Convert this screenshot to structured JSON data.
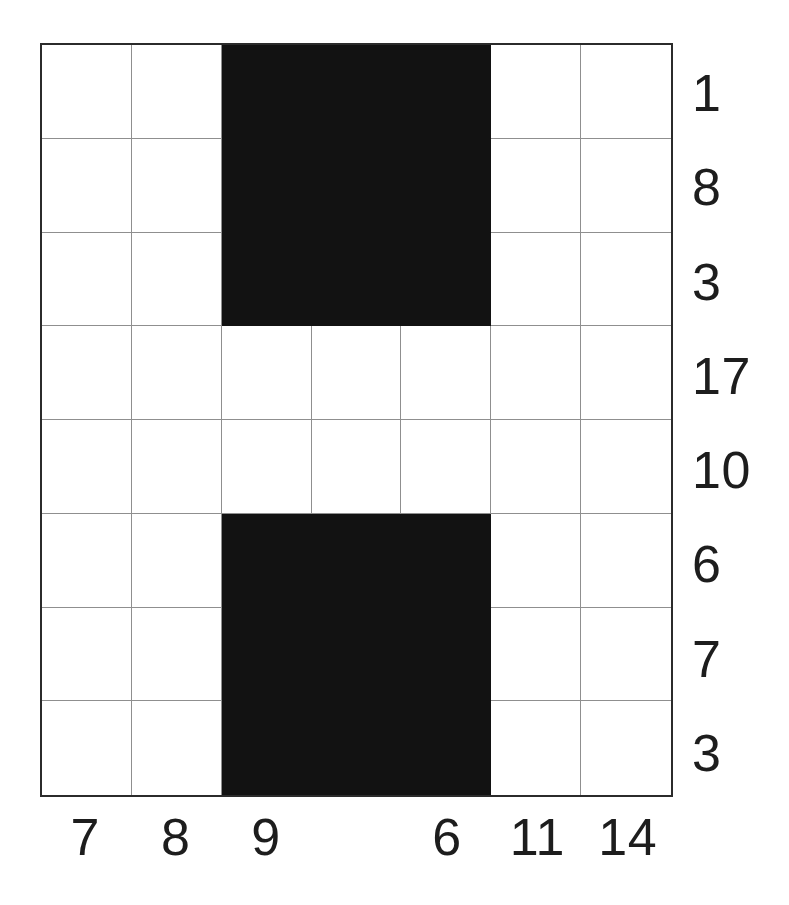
{
  "puzzle": {
    "type": "nonogram-like-grid",
    "columns": 7,
    "rows": 8,
    "fill_color": "#121212",
    "empty_color": "#ffffff",
    "gridline_color": "#8f8f8f",
    "border_color": "#2b2b2b",
    "row_labels": [
      "1",
      "8",
      "3",
      "17",
      "10",
      "6",
      "7",
      "3"
    ],
    "column_labels": [
      "7",
      "8",
      "9",
      "",
      "6",
      "11",
      "14"
    ],
    "cells": [
      [
        0,
        0,
        1,
        1,
        1,
        0,
        0
      ],
      [
        0,
        0,
        1,
        1,
        1,
        0,
        0
      ],
      [
        0,
        0,
        1,
        1,
        1,
        0,
        0
      ],
      [
        0,
        0,
        0,
        0,
        0,
        0,
        0
      ],
      [
        0,
        0,
        0,
        0,
        0,
        0,
        0
      ],
      [
        0,
        0,
        1,
        1,
        1,
        0,
        0
      ],
      [
        0,
        0,
        1,
        1,
        1,
        0,
        0
      ],
      [
        0,
        0,
        1,
        1,
        1,
        0,
        0
      ]
    ]
  },
  "chart_data": {
    "type": "heatmap",
    "title": "",
    "xlabel": "",
    "ylabel": "",
    "grid": true,
    "legend": "none",
    "x_tick_labels": [
      "7",
      "8",
      "9",
      "",
      "6",
      "11",
      "14"
    ],
    "y_tick_labels": [
      "1",
      "8",
      "3",
      "17",
      "10",
      "6",
      "7",
      "3"
    ],
    "x_tick_positions": [
      0,
      1,
      2,
      3,
      4,
      5,
      6
    ],
    "y_tick_positions": [
      0,
      1,
      2,
      3,
      4,
      5,
      6,
      7
    ],
    "values": [
      [
        0,
        0,
        1,
        1,
        1,
        0,
        0
      ],
      [
        0,
        0,
        1,
        1,
        1,
        0,
        0
      ],
      [
        0,
        0,
        1,
        1,
        1,
        0,
        0
      ],
      [
        0,
        0,
        0,
        0,
        0,
        0,
        0
      ],
      [
        0,
        0,
        0,
        0,
        0,
        0,
        0
      ],
      [
        0,
        0,
        1,
        1,
        1,
        0,
        0
      ],
      [
        0,
        0,
        1,
        1,
        1,
        0,
        0
      ],
      [
        0,
        0,
        1,
        1,
        1,
        0,
        0
      ]
    ],
    "colormap": [
      "#ffffff",
      "#121212"
    ],
    "zlim": [
      0,
      1
    ]
  }
}
